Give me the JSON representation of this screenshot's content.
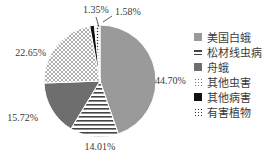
{
  "chart_data": {
    "type": "pie",
    "title": "",
    "categories": [
      "美国白蛾",
      "松材线虫病",
      "舟蛾",
      "其他虫害",
      "其他病害",
      "有害植物"
    ],
    "values": [
      44.7,
      14.01,
      15.72,
      22.65,
      1.35,
      1.58
    ],
    "labels": [
      "44.70%",
      "14.01%",
      "15.72%",
      "22.65%",
      "1.35%",
      "1.58%"
    ],
    "start_angle": "12 o'clock",
    "direction": "clockwise",
    "legend_position": "right",
    "fills": [
      "#9a9a9a",
      "stripes",
      "#6e6e6e",
      "dots",
      "#111111",
      "dotted-small"
    ]
  },
  "legend": {
    "items": [
      {
        "label": "美国白蛾",
        "marker": "■"
      },
      {
        "label": "松材线虫病",
        "marker": "="
      },
      {
        "label": "舟蛾",
        "marker": "■"
      },
      {
        "label": "其他虫害",
        "marker": "⸬"
      },
      {
        "label": "其他病害",
        "marker": "■"
      },
      {
        "label": "有害植物",
        "marker": "↗"
      }
    ]
  }
}
